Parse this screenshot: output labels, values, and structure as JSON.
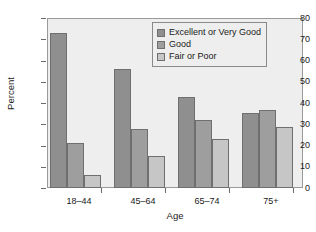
{
  "chart_data": {
    "type": "bar",
    "title": "",
    "xlabel": "Age",
    "ylabel": "Percent",
    "categories": [
      "18–44",
      "45–64",
      "65–74",
      "75+"
    ],
    "series": [
      {
        "name": "Excellent or Very Good",
        "color": "#8f8f8f",
        "values": [
          73,
          56,
          43,
          35.5
        ]
      },
      {
        "name": "Good",
        "color": "#9e9e9e",
        "values": [
          21,
          28,
          32,
          36.5
        ]
      },
      {
        "name": "Fair or Poor",
        "color": "#c6c6c6",
        "values": [
          6,
          15,
          23,
          28.5
        ]
      }
    ],
    "ylim": [
      0,
      80
    ],
    "yticks": [
      0,
      10,
      20,
      30,
      40,
      50,
      60,
      70,
      80
    ],
    "ytick_labels": [
      "0",
      "10",
      "20",
      "30",
      "40",
      "50",
      "60",
      "70",
      "80"
    ],
    "grid": false,
    "legend_position": "top-right",
    "plot_background": "#eeeeee",
    "axis_color": "#6b6b6b"
  },
  "legend": {
    "items": [
      {
        "label": "Excellent or Very Good"
      },
      {
        "label": "Good"
      },
      {
        "label": "Fair or Poor"
      }
    ]
  }
}
